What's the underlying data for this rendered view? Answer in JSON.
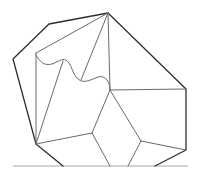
{
  "diagram": {
    "type": "polygonal-tiling",
    "background": "#ffffff",
    "colors": {
      "outline": "#2e2e2e",
      "inner": "#6a6a6a",
      "baseline": "#a8a8a8"
    },
    "vertices": {
      "top": [
        108,
        13
      ],
      "upper_left_shoulder": [
        49,
        24
      ],
      "left": [
        13,
        59
      ],
      "inner_top_left": [
        36,
        53
      ],
      "curve_peak": [
        63,
        61
      ],
      "curve_trough": [
        82,
        81
      ],
      "center": [
        110,
        90
      ],
      "right": [
        186,
        89
      ],
      "bottom_left": [
        36,
        144
      ],
      "mid_left": [
        92,
        133
      ],
      "mid_right": [
        141,
        141
      ],
      "bottom_right": [
        186,
        150
      ]
    },
    "baseline": {
      "x1": 13,
      "x2": 188,
      "y": 166
    },
    "baseline_crossings_x": [
      63,
      110,
      128,
      155
    ],
    "wavy_curve": "M36,55 C40,62 44,66 52,64 C58,62 62,58 66,60 C72,64 72,74 78,79 C84,84 90,80 98,77 C104,75 110,80 110,90"
  }
}
